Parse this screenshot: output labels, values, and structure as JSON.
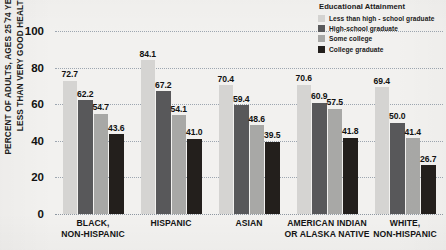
{
  "chart_data": {
    "type": "bar",
    "title": "",
    "xlabel": "",
    "ylabel": "PERCENT OF ADULTS, AGES 25 ̄74 YEARS, IN LESS THAN VERY GOOD HEALTH*",
    "ylim": [
      0,
      100
    ],
    "yticks": [
      "0",
      "20",
      "40",
      "60",
      "80",
      "100"
    ],
    "grid": true,
    "legend_position": "top-right",
    "legend_title": "Educational Attainment",
    "categories": [
      "BLACK,\nNON-HISPANIC",
      "HISPANIC",
      "ASIAN",
      "AMERICAN INDIAN\nOR ALASKA NATIVE",
      "WHITE,\nNON-HISPANIC"
    ],
    "category_lines": [
      [
        "BLACK,",
        "NON-HISPANIC"
      ],
      [
        "HISPANIC"
      ],
      [
        "ASIAN"
      ],
      [
        "AMERICAN INDIAN",
        "OR ALASKA NATIVE"
      ],
      [
        "WHITE,",
        "NON-HISPANIC"
      ]
    ],
    "series": [
      {
        "name": "Less than high - school graduate",
        "color": "#d5d4d2",
        "values": [
          72.7,
          84.1,
          70.4,
          70.6,
          69.4
        ],
        "labels": [
          "72.7",
          "84.1",
          "70.4",
          "70.6",
          "69.4"
        ]
      },
      {
        "name": "High-school graduate",
        "color": "#58585a",
        "values": [
          62.2,
          67.2,
          59.4,
          60.9,
          50.0
        ],
        "labels": [
          "62.2",
          "67.2",
          "59.4",
          "60.9",
          "50.0"
        ]
      },
      {
        "name": "Some college",
        "color": "#a8a8a6",
        "values": [
          54.7,
          54.1,
          48.6,
          57.5,
          41.4
        ],
        "labels": [
          "54.7",
          "54.1",
          "48.6",
          "57.5",
          "41.4"
        ]
      },
      {
        "name": "College graduate",
        "color": "#231f1c",
        "values": [
          43.6,
          41.0,
          39.5,
          41.8,
          26.7
        ],
        "labels": [
          "43.6",
          "41.0",
          "39.5",
          "41.8",
          "26.7"
        ]
      }
    ]
  },
  "legend": {
    "title": "Educational Attainment",
    "items": [
      {
        "label": "Less than high - school graduate",
        "color": "#d5d4d2"
      },
      {
        "label": "High-school graduate",
        "color": "#58585a"
      },
      {
        "label": "Some college",
        "color": "#a8a8a6"
      },
      {
        "label": "College graduate",
        "color": "#231f1c"
      }
    ]
  }
}
